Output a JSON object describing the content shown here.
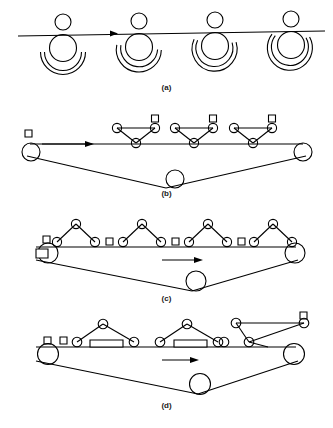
{
  "figure": {
    "background_color": "#ffffff",
    "stroke_color": "#000000",
    "caption_color": "#1a1a1a"
  },
  "panels": [
    {
      "id": "a",
      "caption": "(a)",
      "description": "Four identical units on a horizontal conveyor line: small circle above line, large circle below line, two concentric arcs beneath each large circle, arcs progressively closing left to right",
      "arrow_direction": "right",
      "unit_count": 4,
      "unit_centers_x": [
        62,
        138,
        214,
        290
      ],
      "line_y": 34,
      "small_circle_radius": 8,
      "large_circle_radius": 13,
      "arc_radii": [
        17,
        21
      ],
      "arc_sweep_deg": [
        170,
        200,
        230,
        255
      ]
    },
    {
      "id": "b",
      "caption": "(b)",
      "description": "Belt loop with three pulleys forming a V; three truss triangles with apex-down sit on the upper belt run; each truss has a square above its right node; a lone square at upper left",
      "arrow_direction": "right",
      "truss_count": 3,
      "truss_orientation": "apex-down",
      "square_count": 4,
      "pulley_count": 3
    },
    {
      "id": "c",
      "caption": "(c)",
      "description": "Same belt loop; four truss triangles now flipped apex-up resting on the belt; small squares interleaved between trusses on the belt line; one larger square engaged at the left pulley",
      "arrow_direction": "right",
      "truss_count": 4,
      "truss_orientation": "apex-up",
      "small_square_count": 5,
      "large_square_count": 1,
      "pulley_count": 3
    },
    {
      "id": "d",
      "caption": "(d)",
      "description": "Same belt loop; two completed assemblies each with an apex-up truss spanning a horizontal rectangle panel; two loose squares at left; rightmost truss shown tilted with a square at its raised end",
      "arrow_direction": "right",
      "completed_assembly_count": 2,
      "rectangle_panel_count": 2,
      "tilted_truss_count": 1,
      "loose_square_count": 3,
      "pulley_count": 3
    }
  ],
  "legend": {
    "circle_label": "roller / node",
    "square_label": "block",
    "rectangle_label": "panel",
    "line_label": "conveyor belt",
    "arrow_label": "travel direction"
  }
}
